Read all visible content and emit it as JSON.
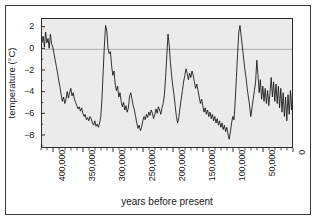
{
  "chart_data": {
    "type": "line",
    "title": "",
    "xlabel": "years before present",
    "ylabel": "temperature (°C)",
    "xlim": [
      420000,
      0
    ],
    "ylim": [
      -9.2,
      2.8
    ],
    "x_reversed": true,
    "grid": false,
    "legend": null,
    "zero_reference_line": 0,
    "y_ticks": [
      2,
      0,
      -2,
      -4,
      -6,
      -8
    ],
    "y_tick_labels": [
      "2",
      "0",
      "−2",
      "−4",
      "−6",
      "−8"
    ],
    "x_ticks": [
      400000,
      350000,
      300000,
      250000,
      200000,
      150000,
      100000,
      50000,
      0
    ],
    "x_tick_labels": [
      "400,000",
      "350,000",
      "300,000",
      "250,000",
      "200,000",
      "150,000",
      "100,000",
      "50,000",
      "0"
    ],
    "x_minor_tick_interval": 10000,
    "series_name": "Vostok ice core temperature anomaly",
    "line_color": "#111111",
    "plot_background": "#ebebeb",
    "x": [
      420000,
      418000,
      416000,
      414000,
      412000,
      410000,
      408000,
      406000,
      404000,
      402000,
      400000,
      398000,
      396000,
      394000,
      392000,
      390000,
      388000,
      386000,
      384000,
      382000,
      380000,
      378000,
      376000,
      374000,
      372000,
      370000,
      368000,
      366000,
      364000,
      362000,
      360000,
      358000,
      356000,
      354000,
      352000,
      350000,
      348000,
      346000,
      344000,
      342000,
      340000,
      338000,
      336000,
      334000,
      332000,
      330000,
      328000,
      326000,
      324000,
      322000,
      320000,
      318000,
      316000,
      314000,
      312000,
      310000,
      308000,
      306000,
      304000,
      302000,
      300000,
      298000,
      296000,
      294000,
      292000,
      290000,
      288000,
      286000,
      284000,
      282000,
      280000,
      278000,
      276000,
      274000,
      272000,
      270000,
      268000,
      266000,
      264000,
      262000,
      260000,
      258000,
      256000,
      254000,
      252000,
      250000,
      248000,
      246000,
      244000,
      242000,
      240000,
      238000,
      236000,
      234000,
      232000,
      230000,
      228000,
      226000,
      224000,
      222000,
      220000,
      218000,
      216000,
      214000,
      212000,
      210000,
      208000,
      206000,
      204000,
      202000,
      200000,
      198000,
      196000,
      194000,
      192000,
      190000,
      188000,
      186000,
      184000,
      182000,
      180000,
      178000,
      176000,
      174000,
      172000,
      170000,
      168000,
      166000,
      164000,
      162000,
      160000,
      158000,
      156000,
      154000,
      152000,
      150000,
      148000,
      146000,
      144000,
      142000,
      140000,
      138000,
      136000,
      134000,
      132000,
      130000,
      128000,
      126000,
      124000,
      122000,
      120000,
      118000,
      116000,
      114000,
      112000,
      110000,
      108000,
      106000,
      104000,
      102000,
      100000,
      98000,
      96000,
      94000,
      92000,
      90000,
      88000,
      86000,
      84000,
      82000,
      80000,
      78000,
      76000,
      74000,
      72000,
      70000,
      68000,
      66000,
      64000,
      62000,
      60000,
      58000,
      56000,
      54000,
      52000,
      50000,
      48000,
      46000,
      44000,
      42000,
      40000,
      38000,
      36000,
      34000,
      32000,
      30000,
      28000,
      26000,
      24000,
      22000,
      20000,
      18000,
      16000,
      14000,
      12000,
      10000,
      8000,
      6000,
      4000,
      2000,
      0
    ],
    "y": [
      0.6,
      1.2,
      0.2,
      1.6,
      0.6,
      1.0,
      0.1,
      1.4,
      0.5,
      0.2,
      -0.4,
      -1.0,
      -1.6,
      -2.2,
      -2.9,
      -3.5,
      -4.2,
      -4.8,
      -4.4,
      -5.0,
      -4.6,
      -3.9,
      -4.5,
      -4.0,
      -3.6,
      -4.3,
      -4.0,
      -4.6,
      -4.9,
      -5.2,
      -5.5,
      -5.3,
      -5.7,
      -5.4,
      -5.9,
      -6.2,
      -6.0,
      -6.5,
      -6.3,
      -6.6,
      -6.2,
      -6.4,
      -6.8,
      -7.0,
      -6.6,
      -7.1,
      -6.9,
      -7.2,
      -6.8,
      -6.2,
      -4.5,
      -2.0,
      0.4,
      2.2,
      1.7,
      0.1,
      -0.4,
      -0.2,
      -1.5,
      -2.4,
      -2.0,
      -3.2,
      -3.8,
      -3.4,
      -4.4,
      -4.0,
      -4.8,
      -5.3,
      -4.9,
      -5.6,
      -5.2,
      -5.8,
      -5.4,
      -4.3,
      -4.0,
      -4.6,
      -5.2,
      -5.6,
      -6.2,
      -6.8,
      -7.3,
      -7.0,
      -7.5,
      -7.2,
      -6.6,
      -6.2,
      -6.5,
      -6.0,
      -6.3,
      -5.8,
      -6.1,
      -5.6,
      -5.9,
      -6.4,
      -6.0,
      -5.5,
      -5.9,
      -5.3,
      -5.6,
      -6.0,
      -5.4,
      -5.0,
      -4.2,
      -2.6,
      -0.6,
      1.4,
      0.4,
      -1.2,
      -2.4,
      -3.4,
      -4.2,
      -5.2,
      -6.2,
      -6.8,
      -6.3,
      -5.4,
      -4.6,
      -3.8,
      -3.0,
      -2.4,
      -1.8,
      -2.2,
      -2.8,
      -2.2,
      -2.6,
      -2.0,
      -2.4,
      -3.0,
      -3.6,
      -3.2,
      -3.8,
      -4.4,
      -5.0,
      -4.6,
      -5.2,
      -5.8,
      -5.4,
      -6.0,
      -5.6,
      -6.2,
      -5.8,
      -6.4,
      -6.0,
      -6.6,
      -6.2,
      -6.8,
      -6.4,
      -7.0,
      -6.6,
      -7.2,
      -6.8,
      -7.4,
      -7.0,
      -7.6,
      -7.2,
      -7.8,
      -8.3,
      -7.6,
      -6.8,
      -6.2,
      -6.5,
      -4.8,
      -2.6,
      -0.4,
      1.6,
      2.2,
      1.2,
      0.2,
      -0.8,
      -1.8,
      -2.6,
      -3.6,
      -4.4,
      -5.2,
      -6.2,
      -5.4,
      -4.6,
      -3.8,
      -3.0,
      -1.0,
      -2.4,
      -4.0,
      -2.8,
      -4.6,
      -3.4,
      -4.8,
      -3.6,
      -5.0,
      -3.8,
      -5.2,
      -4.0,
      -2.6,
      -4.4,
      -3.0,
      -4.8,
      -3.2,
      -5.0,
      -3.4,
      -5.4,
      -3.6,
      -5.8,
      -4.0,
      -6.2,
      -4.4,
      -6.6,
      -4.2,
      -6.0,
      -3.8,
      -5.6,
      -3.4,
      -5.2,
      -3.0,
      -4.8,
      -3.4,
      -5.6,
      -4.0,
      -6.2,
      -4.6,
      -6.8,
      -5.0,
      -7.4,
      -5.4,
      -8.2,
      -5.8,
      -7.8,
      -5.2,
      -8.4,
      -6.0,
      -7.4,
      -5.0,
      -8.0,
      -5.6,
      -7.2,
      -4.6,
      -6.6,
      -4.2,
      -6.0,
      -3.6,
      -7.2,
      -4.2,
      -6.4,
      -3.2,
      -5.8,
      -2.8,
      -5.4,
      -2.4,
      -6.2,
      -3.0,
      -7.4,
      -3.8,
      -6.6,
      -2.6,
      -5.0,
      -1.6,
      -0.4,
      0.6,
      -0.2,
      0.8,
      0.0,
      1.0,
      0.4,
      1.4,
      0.8,
      2.0
    ]
  }
}
